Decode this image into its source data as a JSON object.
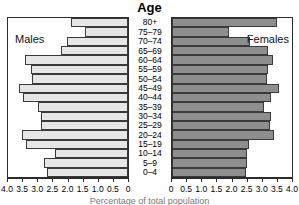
{
  "chart_data": {
    "type": "bar",
    "subtype": "population-pyramid",
    "title": "Age",
    "xlabel": "Percentage of total population",
    "ylabel": "Age",
    "categories": [
      "80+",
      "75–79",
      "70–74",
      "65–69",
      "60–64",
      "55–59",
      "50–54",
      "45–49",
      "40–44",
      "35–39",
      "30–34",
      "25–29",
      "20–24",
      "15–19",
      "10–14",
      "5–9",
      "0–4"
    ],
    "series": [
      {
        "name": "Males",
        "side": "left",
        "color": "#e6e6e6",
        "values": [
          1.9,
          1.45,
          2.05,
          2.25,
          3.45,
          3.25,
          3.2,
          3.65,
          3.5,
          3.0,
          2.9,
          2.9,
          3.55,
          3.4,
          2.45,
          2.8,
          2.7
        ]
      },
      {
        "name": "Females",
        "side": "right",
        "color": "#8e8e8e",
        "values": [
          3.5,
          1.9,
          2.6,
          3.2,
          3.35,
          3.2,
          3.15,
          3.55,
          3.3,
          3.05,
          3.3,
          3.25,
          3.4,
          2.55,
          2.5,
          2.5,
          2.45
        ]
      }
    ],
    "xlim": [
      0,
      4.0
    ],
    "xticks": [
      0,
      0.5,
      1.0,
      1.5,
      2.0,
      2.5,
      3.0,
      3.5,
      4.0
    ],
    "xtick_labels_left": [
      "4.0",
      "3.5",
      "3.0",
      "2.5",
      "2.0",
      "1.5",
      "1.0",
      "0.5",
      "0"
    ],
    "xtick_labels_right": [
      "0",
      "0.5",
      "1.0",
      "1.5",
      "2.0",
      "2.5",
      "3.0",
      "3.5",
      "4.0"
    ],
    "grid": false,
    "legend": "in-panel-corner-labels"
  },
  "labels": {
    "males": "Males",
    "females": "Females"
  },
  "colors": {
    "male_bar": "#e6e6e6",
    "female_bar": "#8e8e8e",
    "axis": "#2b2b2b",
    "bar_outline": "#3a3a3a"
  }
}
